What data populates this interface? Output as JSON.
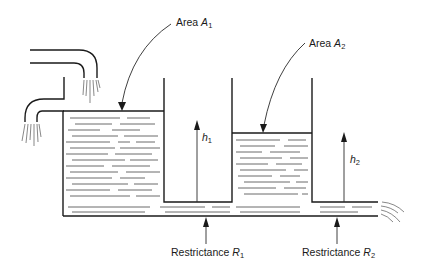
{
  "figure": {
    "type": "two-tank liquid-level system (interacting tanks)",
    "labels": {
      "area1": {
        "prefix": "Area ",
        "var": "A",
        "sub": "1"
      },
      "area2": {
        "prefix": "Area ",
        "var": "A",
        "sub": "2"
      },
      "h1": {
        "var": "h",
        "sub": "1"
      },
      "h2": {
        "var": "h",
        "sub": "2"
      },
      "r1": {
        "prefix": "Restrictance ",
        "var": "R",
        "sub": "1"
      },
      "r2": {
        "prefix": "Restrictance ",
        "var": "R",
        "sub": "2"
      }
    },
    "components": [
      "inlet-pipe-upper",
      "inlet-pipe-lower",
      "tank-1",
      "tank-2",
      "connecting-pipe",
      "outlet"
    ],
    "colors": {
      "line": "#1a1a1a",
      "background": "#ffffff"
    }
  }
}
